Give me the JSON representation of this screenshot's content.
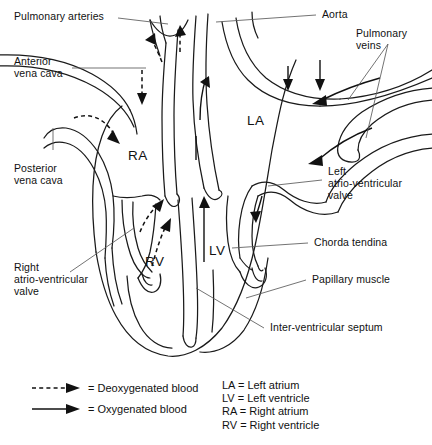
{
  "figure": {
    "type": "anatomical-diagram"
  },
  "labels": {
    "pulmonary_arteries": "Pulmonary arteries",
    "anterior_vena_cava": "Anterior\nvena cava",
    "posterior_vena_cava": "Posterior\nvena cava",
    "right_av_valve": "Right\natrio-ventricular\nvalve",
    "aorta": "Aorta",
    "pulmonary_veins": "Pulmonary\nveins",
    "left_av_valve": "Left\natrio-ventricular\nvalve",
    "chorda_tendina": "Chorda tendina",
    "papillary_muscle": "Papillary muscle",
    "inter_ventricular_septum": "Inter-ventricular septum"
  },
  "chambers": {
    "right_atrium": "RA",
    "left_atrium": "LA",
    "right_ventricle": "RV",
    "left_ventricle": "LV"
  },
  "legend": {
    "flow": [
      {
        "key": "deoxygenated",
        "style": "dashed-arrow",
        "text": "= Deoxygenated blood"
      },
      {
        "key": "oxygenated",
        "style": "solid-arrow",
        "text": "= Oxygenated blood"
      }
    ],
    "abbreviations": "LA = Left atrium\nLV = Left ventricle\nRA = Right atrium\nRV = Right ventricle"
  },
  "colors": {
    "stroke": "#1a1a1a",
    "leader": "#5a5a5a",
    "background": "#ffffff",
    "text": "#111111"
  }
}
